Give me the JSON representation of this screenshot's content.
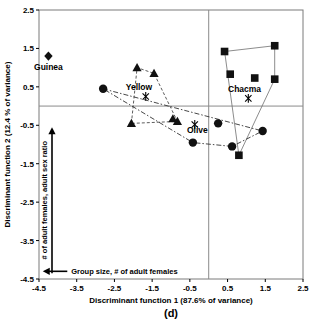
{
  "chart_data": {
    "type": "scatter",
    "title": "",
    "panel_label": "(d)",
    "xlabel": "Discriminant function 1 (87.6% of variance)",
    "ylabel": "Discriminant function 2 (12.4 % of variance)",
    "xlim": [
      -4.5,
      2.5
    ],
    "ylim": [
      -4.5,
      2.5
    ],
    "xticks": [
      -4.5,
      -3.5,
      -2.5,
      -1.5,
      -0.5,
      0.5,
      1.5,
      2.5
    ],
    "xtick_labels": [
      "-4.5",
      "-3.5",
      "-2.5",
      "-1.5",
      "-0.5",
      "0.5",
      "1.5",
      "2.5"
    ],
    "yticks": [
      -4.5,
      -3.5,
      -2.5,
      -1.5,
      -0.5,
      0.5,
      1.5,
      2.5
    ],
    "ytick_labels": [
      "-4.5",
      "-3.5",
      "-2.5",
      "-1.5",
      "-0.5",
      "0.5",
      "1.5",
      "2.5"
    ],
    "grid": false,
    "legend": "none",
    "origin_lines": {
      "x": 0.0,
      "y": 0.0
    },
    "annotations": [
      {
        "name": "y-axis-loading-arrow",
        "text": "# of adult females, adult sex ratio",
        "direction": "up",
        "orientation": "vertical"
      },
      {
        "name": "x-axis-loading-arrow",
        "text": "Group size, # of adult females",
        "direction": "left",
        "orientation": "horizontal"
      }
    ],
    "series": [
      {
        "name": "Guinea",
        "label": "Guinea",
        "marker": "diamond",
        "label_x": -4.25,
        "label_y": 0.95,
        "hull": "none",
        "points": [
          {
            "x": -4.25,
            "y": 1.3
          }
        ],
        "centroid": null
      },
      {
        "name": "Yellow",
        "label": "Yellow",
        "marker": "triangle",
        "label_x": -1.85,
        "label_y": 0.42,
        "hull": "dashed",
        "points": [
          {
            "x": -1.9,
            "y": 1.0
          },
          {
            "x": -1.45,
            "y": 0.85
          },
          {
            "x": -2.05,
            "y": -0.45
          },
          {
            "x": -0.95,
            "y": -0.33
          },
          {
            "x": -0.83,
            "y": -0.4
          }
        ],
        "centroid": {
          "x": -1.67,
          "y": 0.25
        }
      },
      {
        "name": "Chacma",
        "label": "Chacma",
        "marker": "square",
        "label_x": 0.95,
        "label_y": 0.36,
        "hull": "solid",
        "points": [
          {
            "x": 0.42,
            "y": 1.42
          },
          {
            "x": 1.75,
            "y": 1.57
          },
          {
            "x": 0.57,
            "y": 0.83
          },
          {
            "x": 1.22,
            "y": 0.73
          },
          {
            "x": 1.75,
            "y": 0.7
          },
          {
            "x": 0.8,
            "y": -1.28
          }
        ],
        "centroid": {
          "x": 1.05,
          "y": 0.2
        }
      },
      {
        "name": "Olive",
        "label": "Olive",
        "marker": "circle",
        "label_x": -0.3,
        "label_y": -0.7,
        "hull": "dashdot",
        "points": [
          {
            "x": -2.8,
            "y": 0.45
          },
          {
            "x": -0.42,
            "y": -0.95
          },
          {
            "x": 0.25,
            "y": -0.45
          },
          {
            "x": 0.62,
            "y": -1.05
          },
          {
            "x": 1.43,
            "y": -0.65
          }
        ],
        "centroid": {
          "x": -0.37,
          "y": -0.48
        }
      }
    ]
  }
}
